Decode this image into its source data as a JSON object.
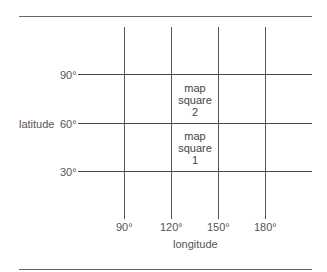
{
  "diagram": {
    "axes": {
      "y_title": "latitude",
      "x_title": "longitude",
      "y_ticks": [
        "90°",
        "60°",
        "30°"
      ],
      "x_ticks": [
        "90°",
        "120°",
        "150°",
        "180°"
      ]
    },
    "cells": [
      {
        "line1": "map",
        "line2": "square",
        "line3": "2"
      },
      {
        "line1": "map",
        "line2": "square",
        "line3": "1"
      }
    ]
  }
}
